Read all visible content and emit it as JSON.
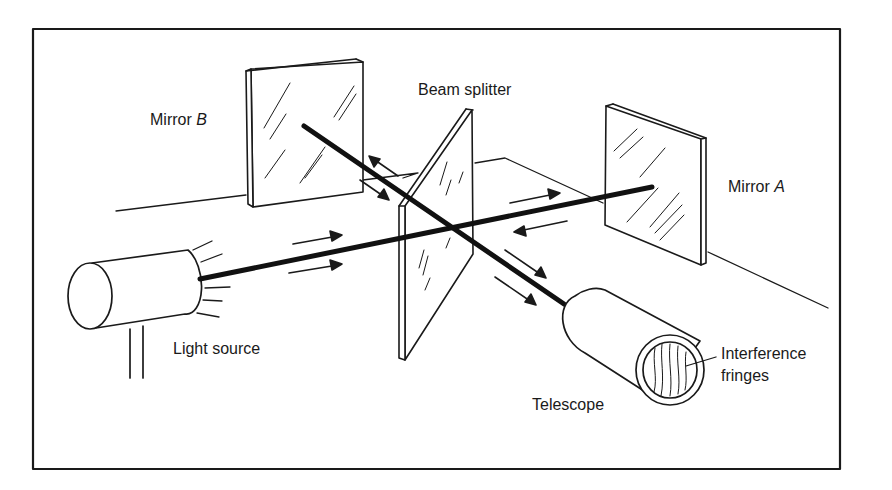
{
  "diagram": {
    "labels": {
      "mirror_b_prefix": "Mirror ",
      "mirror_b_letter": "B",
      "beam_splitter": "Beam splitter",
      "mirror_a_prefix": "Mirror ",
      "mirror_a_letter": "A",
      "light_source": "Light source",
      "telescope": "Telescope",
      "interference_line1": "Interference",
      "interference_line2": "fringes"
    },
    "components": [
      "Light source",
      "Beam splitter",
      "Mirror A",
      "Mirror B",
      "Telescope"
    ],
    "colors": {
      "ink": "#1a1a1a",
      "background": "#ffffff"
    }
  }
}
